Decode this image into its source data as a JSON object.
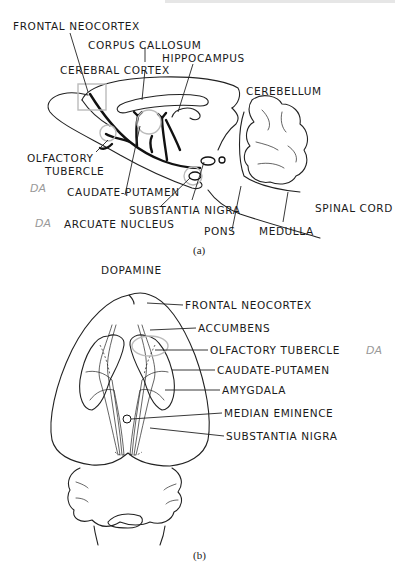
{
  "header": {
    "faded_text": ""
  },
  "panel_a": {
    "caption": "(a)",
    "labels": {
      "frontal_neocortex": "FRONTAL NEOCORTEX",
      "corpus_callosum": "CORPUS CALLOSUM",
      "hippocampus": "HIPPOCAMPUS",
      "cerebral_cortex": "CEREBRAL CORTEX",
      "cerebellum": "CEREBELLUM",
      "olfactory_tubercle_1": "OLFACTORY",
      "olfactory_tubercle_2": "TUBERCLE",
      "caudate_putamen": "CAUDATE-PUTAMEN",
      "substantia_nigra": "SUBSTANTIA NIGRA",
      "arcuate_nucleus": "ARCUATE NUCLEUS",
      "pons": "PONS",
      "medulla": "MEDULLA",
      "spinal_cord": "SPINAL CORD"
    },
    "handwritten": [
      "DA",
      "DA"
    ]
  },
  "panel_b": {
    "title": "DOPAMINE",
    "caption": "(b)",
    "labels": {
      "frontal_neocortex": "FRONTAL NEOCORTEX",
      "accumbens": "ACCUMBENS",
      "olfactory_tubercle": "OLFACTORY TUBERCLE",
      "caudate_putamen": "CAUDATE-PUTAMEN",
      "amygdala": "AMYGDALA",
      "median_eminence": "MEDIAN EMINENCE",
      "substantia_nigra": "SUBSTANTIA NIGRA"
    },
    "handwritten": "DA"
  }
}
